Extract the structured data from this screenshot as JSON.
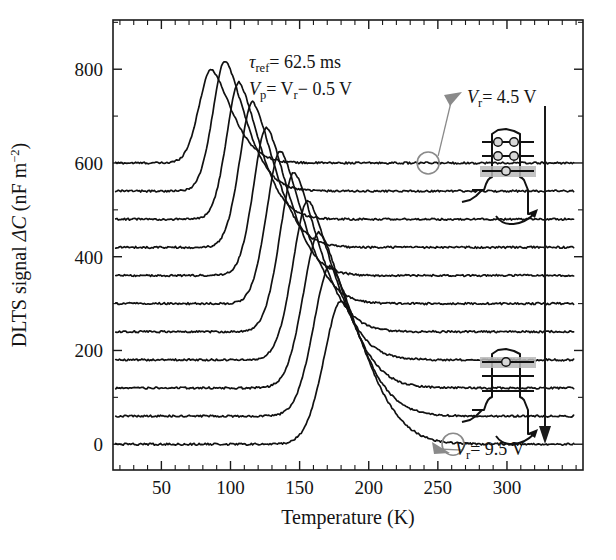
{
  "chart_data": {
    "type": "line",
    "title": "",
    "xlabel": "Temperature (K)",
    "ylabel": "DLTS signal ΔC (nF m−2)",
    "xlim": [
      15,
      355
    ],
    "ylim": [
      -55,
      905
    ],
    "xticks": [
      50,
      100,
      150,
      200,
      250,
      300
    ],
    "xticklabels": [
      "50",
      "100",
      "150",
      "200",
      "250",
      "300"
    ],
    "xtick_minor_step": 10,
    "yticks": [
      0,
      200,
      400,
      600,
      800
    ],
    "yticklabels": [
      "0",
      "200",
      "400",
      "600",
      "800"
    ],
    "ytick_minor_step": 100,
    "grid": false,
    "legend": "none",
    "series_note": "Eleven vertically offset DLTS temperature scans; reverse bias V_r increases from 4.5 V (top trace) to 9.5 V (bottom trace) in 0.5 V steps. Each trace is offset by 60 nF m^-2.",
    "offset_step": 60,
    "series": [
      {
        "name": "V_r = 4.5 V",
        "baseline": 600,
        "peak_T": 86,
        "peak_value": 800,
        "peak_amplitude": 200,
        "width": 17
      },
      {
        "name": "V_r = 5.0 V",
        "baseline": 540,
        "peak_T": 96,
        "peak_value": 818,
        "peak_amplitude": 278,
        "width": 17
      },
      {
        "name": "V_r = 5.5 V",
        "baseline": 480,
        "peak_T": 106,
        "peak_value": 772,
        "peak_amplitude": 292,
        "width": 17
      },
      {
        "name": "V_r = 6.0 V",
        "baseline": 420,
        "peak_T": 116,
        "peak_value": 730,
        "peak_amplitude": 310,
        "width": 18
      },
      {
        "name": "V_r = 6.5 V",
        "baseline": 360,
        "peak_T": 126,
        "peak_value": 676,
        "peak_amplitude": 316,
        "width": 18
      },
      {
        "name": "V_r = 7.0 V",
        "baseline": 300,
        "peak_T": 136,
        "peak_value": 626,
        "peak_amplitude": 326,
        "width": 19
      },
      {
        "name": "V_r = 7.5 V",
        "baseline": 240,
        "peak_T": 146,
        "peak_value": 580,
        "peak_amplitude": 340,
        "width": 20
      },
      {
        "name": "V_r = 8.0 V",
        "baseline": 180,
        "peak_T": 156,
        "peak_value": 520,
        "peak_amplitude": 340,
        "width": 21
      },
      {
        "name": "V_r = 8.5 V",
        "baseline": 120,
        "peak_T": 164,
        "peak_value": 452,
        "peak_amplitude": 332,
        "width": 22
      },
      {
        "name": "V_r = 9.0 V",
        "baseline": 60,
        "peak_T": 172,
        "peak_value": 380,
        "peak_amplitude": 320,
        "width": 23
      },
      {
        "name": "V_r = 9.5 V",
        "baseline": 0,
        "peak_T": 180,
        "peak_value": 305,
        "peak_amplitude": 305,
        "width": 24
      }
    ],
    "annotations": {
      "tau_ref": "τref = 62.5 ms",
      "tau_ref_symbol": "τ",
      "tau_ref_sub": "ref",
      "tau_ref_value": "= 62.5 ms",
      "vp_symbol": "V",
      "vp_sub": "p",
      "vp_value": "= V",
      "vp_sub2": "r",
      "vp_tail": "− 0.5 V",
      "top_label_symbol": "V",
      "top_label_sub": "r",
      "top_label_value": "= 4.5 V",
      "bottom_label_symbol": "V",
      "bottom_label_sub": "r",
      "bottom_label_value": "= 9.5 V",
      "top_marker_point": [
        243,
        600
      ],
      "bottom_marker_point": [
        261,
        0
      ],
      "direction_arrow": "increasing reverse bias"
    },
    "insets": [
      {
        "name": "band-diagram-top",
        "levels": 3,
        "highlighted_level": "bottom",
        "electrons": [
          2,
          2,
          1
        ],
        "description": "quantum well with three confined levels, electrons filling all levels, emission from lowest highlighted level"
      },
      {
        "name": "band-diagram-bottom",
        "levels": 3,
        "highlighted_level": "top",
        "electrons": [
          1,
          0,
          0
        ],
        "description": "quantum well with three confined levels, single electron in highest highlighted level, emission over barrier"
      }
    ]
  },
  "colors": {
    "trace": "#111111",
    "axis": "#1a1a1a",
    "marker": "#8a8a8a",
    "highlight": "#b9b9b9"
  }
}
